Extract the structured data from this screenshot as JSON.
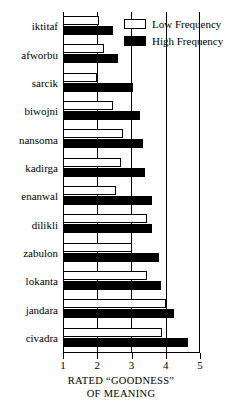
{
  "chart_data": {
    "type": "bar",
    "orientation": "horizontal",
    "title": "",
    "xlabel": "RATED “GOODNESS” OF MEANING",
    "xlabel_lines": [
      "RATED “GOODNESS”",
      "OF MEANING"
    ],
    "ylabel": "",
    "xlim": [
      1,
      5
    ],
    "xticks": [
      1,
      2,
      3,
      4,
      5
    ],
    "xticklabels": [
      "1",
      "2",
      "3",
      "4",
      "5"
    ],
    "grid": true,
    "grid_axis": "x",
    "legend_position": "top-right",
    "categories": [
      "iktitaf",
      "afworbu",
      "sarcik",
      "biwojni",
      "nansoma",
      "kadirga",
      "enanwal",
      "dilikli",
      "zabulon",
      "lokanta",
      "jandara",
      "civadra"
    ],
    "series": [
      {
        "name": "Low Frequency",
        "color": "#ffffff",
        "edge_color": "#000000",
        "values": [
          2.05,
          2.2,
          2.0,
          2.45,
          2.75,
          2.7,
          2.55,
          3.45,
          3.0,
          3.45,
          4.0,
          3.9
        ]
      },
      {
        "name": "High Frequency",
        "color": "#000000",
        "edge_color": "#000000",
        "values": [
          2.45,
          2.6,
          3.05,
          3.25,
          3.35,
          3.4,
          3.6,
          3.6,
          3.8,
          3.85,
          4.25,
          4.65
        ]
      }
    ]
  },
  "legend": {
    "items": [
      {
        "label": "Low Frequency",
        "swatch": "open-white-square"
      },
      {
        "label": "High Frequency",
        "swatch": "filled-black-square"
      }
    ]
  }
}
